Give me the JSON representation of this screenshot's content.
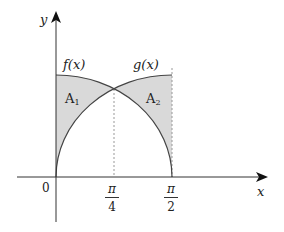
{
  "axes": {
    "x_label": "x",
    "y_label": "y",
    "origin_label": "0",
    "ticks": [
      {
        "num": "π",
        "den": "4"
      },
      {
        "num": "π",
        "den": "2"
      }
    ]
  },
  "curves": {
    "f_label": "f(x)",
    "g_label": "g(x)"
  },
  "regions": {
    "a1": {
      "main": "A",
      "sub": "1"
    },
    "a2": {
      "main": "A",
      "sub": "2"
    }
  },
  "colors": {
    "shade": "#d9d9d9",
    "curve": "#444444",
    "axis": "#333333",
    "dashed": "#999999"
  }
}
